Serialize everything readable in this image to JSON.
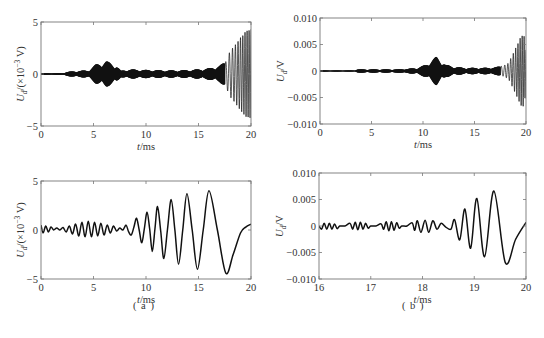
{
  "figure": {
    "panel_labels": [
      "( a )",
      "( b )"
    ]
  },
  "chart_data": [
    {
      "id": "a-top",
      "type": "line",
      "panel": "a",
      "title": "",
      "xlabel": "t/ms",
      "ylabel": "U_d/(×10⁻³ V)",
      "ylabel_parts": {
        "main": "U",
        "sub": "d",
        "rest": "/(×10",
        "sup": "−3",
        "tail": " V)"
      },
      "xlim": [
        0,
        20
      ],
      "ylim": [
        -5,
        5
      ],
      "xticks": [
        0,
        5,
        10,
        15,
        20
      ],
      "yticks": [
        -5,
        0,
        5
      ],
      "xtick_labels": [
        "0",
        "5",
        "10",
        "15",
        "20"
      ],
      "ytick_labels": [
        "−5",
        "0",
        "5"
      ],
      "grid": false,
      "legend": null,
      "description": "Dense high-frequency oscillation; quiet baseline 0–2 ms, packet peaking ~1.2 at ~6.2 ms, small periodic packets (~0.4) every ~1.2 ms from 7.5–16.5 ms, growing swing 17.5–20 ms reaching ~+4.1 / −4.3.",
      "envelope": {
        "x": [
          0,
          2,
          2.5,
          3.5,
          4.5,
          5.2,
          6.2,
          7.2,
          7.6,
          8.3,
          9.7,
          10.8,
          12,
          13,
          14,
          15,
          16,
          17,
          17.6,
          18,
          18.5,
          19,
          19.5,
          20
        ],
        "amplitude": [
          0.08,
          0.08,
          0.2,
          0.3,
          0.35,
          0.9,
          1.25,
          0.8,
          0.3,
          0.45,
          0.4,
          0.38,
          0.35,
          0.35,
          0.38,
          0.45,
          0.55,
          0.8,
          1.2,
          2.2,
          2.8,
          3.5,
          4.1,
          4.3
        ]
      },
      "carrier": {
        "description": "packets at ~1.2 ms spacing, carrier frequency high (dense fill)"
      }
    },
    {
      "id": "b-top",
      "type": "line",
      "panel": "b",
      "title": "",
      "xlabel": "t/ms",
      "ylabel": "U_d/V",
      "ylabel_parts": {
        "main": "U",
        "sub": "d",
        "rest": "/V"
      },
      "xlim": [
        0,
        20
      ],
      "ylim": [
        -0.01,
        0.01
      ],
      "xticks": [
        0,
        5,
        10,
        15,
        20
      ],
      "yticks": [
        -0.01,
        -0.005,
        0,
        0.005,
        0.01
      ],
      "xtick_labels": [
        "0",
        "5",
        "10",
        "15",
        "20"
      ],
      "ytick_labels": [
        "−0.010",
        "−0.005",
        "0",
        "0.005",
        "0.010"
      ],
      "grid": false,
      "legend": null,
      "description": "Flat until ~3.5 ms, tiny packets at ~4, ~6, ~8 ms; main packet peaking ~0.0025 at ~11.3 ms; small packets to ~18 ms; final growing swing reaching ~+0.0063 / −0.0070 near 19.5 ms.",
      "envelope": {
        "x": [
          0,
          3.4,
          3.6,
          4.5,
          5.8,
          6.8,
          7.5,
          8.5,
          9.5,
          10.3,
          11.3,
          12.2,
          13,
          14,
          15,
          16,
          17,
          17.8,
          18.3,
          18.8,
          19.2,
          19.5,
          19.8,
          20
        ],
        "amplitude": [
          0.0001,
          0.0001,
          0.0003,
          0.0003,
          0.0003,
          0.0003,
          0.0003,
          0.0004,
          0.0006,
          0.0012,
          0.0027,
          0.0012,
          0.0008,
          0.0006,
          0.0006,
          0.0006,
          0.0007,
          0.001,
          0.0015,
          0.0035,
          0.0052,
          0.0065,
          0.0068,
          0.004
        ]
      }
    },
    {
      "id": "a-bottom",
      "type": "line",
      "panel": "a",
      "title": "",
      "xlabel": "t/ms",
      "ylabel": "U_d/(×10⁻³ V)",
      "ylabel_parts": {
        "main": "U",
        "sub": "d",
        "rest": "/(×10",
        "sup": "−3",
        "tail": " V)"
      },
      "xlim": [
        0,
        20
      ],
      "ylim": [
        -5,
        5
      ],
      "xticks": [
        0,
        5,
        10,
        15,
        20
      ],
      "yticks": [
        -5,
        0,
        5
      ],
      "xtick_labels": [
        "0",
        "5",
        "10",
        "15",
        "20"
      ],
      "ytick_labels": [
        "−5",
        "0",
        "5"
      ],
      "grid": false,
      "legend": null,
      "description": "Filtered low-frequency waveform; small oscillations (~0.5) to 8 ms, then growing oscillation with period ~1.3 ms; final large trough ~−4.4 at 17.6 ms, rising to ~+0.6 at 20 ms.",
      "peaks": {
        "x": [
          9.1,
          10.1,
          11.1,
          12.4,
          13.9,
          16.0
        ],
        "y": [
          1.2,
          1.8,
          2.4,
          3.1,
          3.7,
          4.0
        ]
      },
      "troughs": {
        "x": [
          8.6,
          9.6,
          10.6,
          11.7,
          13.1,
          14.9,
          17.6
        ],
        "y": [
          -0.5,
          -1.3,
          -2.2,
          -2.9,
          -3.5,
          -4.0,
          -4.4
        ]
      },
      "points": {
        "x": [
          0,
          0.2,
          0.45,
          0.7,
          0.95,
          1.2,
          1.5,
          1.8,
          2.1,
          2.4,
          2.7,
          3.0,
          3.3,
          3.6,
          3.9,
          4.2,
          4.5,
          4.8,
          5.1,
          5.4,
          5.7,
          6.0,
          6.3,
          6.6,
          6.9,
          7.2,
          7.5,
          7.8,
          8.1,
          8.35,
          8.6,
          8.85,
          9.1,
          9.35,
          9.6,
          9.85,
          10.1,
          10.35,
          10.6,
          10.85,
          11.1,
          11.4,
          11.7,
          12.05,
          12.4,
          12.75,
          13.1,
          13.5,
          13.9,
          14.4,
          14.9,
          15.45,
          16.0,
          16.8,
          17.6,
          18.3,
          19.0,
          19.5,
          20.0
        ],
        "y": [
          0.5,
          -0.3,
          0.4,
          -0.2,
          0.3,
          0.0,
          0.2,
          0.0,
          0.25,
          -0.2,
          0.4,
          -0.4,
          0.6,
          -0.6,
          0.8,
          -0.7,
          0.9,
          -0.7,
          0.8,
          -0.6,
          0.7,
          -0.5,
          0.5,
          -0.3,
          0.4,
          -0.1,
          0.2,
          0.0,
          0.5,
          -0.2,
          -0.5,
          0.3,
          1.2,
          0.0,
          -1.3,
          0.2,
          1.8,
          0.1,
          -2.2,
          0.1,
          2.4,
          -0.1,
          -2.9,
          0.1,
          3.1,
          0.0,
          -3.5,
          0.0,
          3.7,
          0.0,
          -4.0,
          0.0,
          4.0,
          0.0,
          -4.4,
          -2.5,
          -0.3,
          0.3,
          0.6
        ]
      }
    },
    {
      "id": "b-bottom",
      "type": "line",
      "panel": "b",
      "title": "",
      "xlabel": "t/ms",
      "ylabel": "U_d/V",
      "ylabel_parts": {
        "main": "U",
        "sub": "d",
        "rest": "/V"
      },
      "xlim": [
        16,
        20
      ],
      "ylim": [
        -0.01,
        0.01
      ],
      "xticks": [
        16,
        17,
        18,
        19,
        20
      ],
      "yticks": [
        -0.01,
        -0.005,
        0,
        0.005,
        0.01
      ],
      "xtick_labels": [
        "16",
        "17",
        "18",
        "19",
        "20"
      ],
      "ytick_labels": [
        "−0.010",
        "−0.005",
        "0",
        "0.005",
        "0.010"
      ],
      "grid": false,
      "legend": null,
      "description": "Zoom of last 4 ms; small ripples (~0.0005) in groups through 18.4 ms, then growing swings: peaks 0.0012@18.6, 0.0052@18.8, 0.0053@19.05, 0.0066@19.4; troughs −0.0025@18.7, −0.0042@18.93, −0.0058@19.2, −0.0069@19.6; rising to ~0.0007 at 20 ms.",
      "peaks": {
        "x": [
          18.62,
          18.82,
          19.05,
          19.38
        ],
        "y": [
          0.0012,
          0.0032,
          0.0052,
          0.0066
        ]
      },
      "troughs": {
        "x": [
          18.72,
          18.93,
          19.2,
          19.6
        ],
        "y": [
          -0.0026,
          -0.0042,
          -0.0058,
          -0.0069
        ]
      },
      "points": {
        "x": [
          16.0,
          16.05,
          16.1,
          16.15,
          16.2,
          16.25,
          16.3,
          16.35,
          16.4,
          16.5,
          16.6,
          16.65,
          16.7,
          16.75,
          16.8,
          16.85,
          16.9,
          16.95,
          17.0,
          17.1,
          17.2,
          17.25,
          17.3,
          17.35,
          17.4,
          17.45,
          17.5,
          17.55,
          17.6,
          17.7,
          17.8,
          17.85,
          17.9,
          17.97,
          18.05,
          18.12,
          18.2,
          18.28,
          18.36,
          18.45,
          18.55,
          18.62,
          18.72,
          18.82,
          18.93,
          19.05,
          19.2,
          19.38,
          19.6,
          19.8,
          20.0
        ],
        "y": [
          0.0,
          -0.0006,
          0.0005,
          -0.0006,
          0.0005,
          -0.0006,
          0.0004,
          -0.0005,
          0.0,
          0.0,
          0.0005,
          -0.0006,
          0.0007,
          -0.0007,
          0.0007,
          -0.0006,
          0.0005,
          -0.0004,
          0.0,
          0.0,
          0.0004,
          -0.0006,
          0.0008,
          -0.0009,
          0.0008,
          -0.0008,
          0.0006,
          -0.0004,
          0.0,
          0.0,
          0.0006,
          -0.0008,
          0.001,
          -0.0012,
          0.0011,
          -0.0012,
          0.001,
          -0.0006,
          0.0005,
          -0.0002,
          -0.0006,
          0.0012,
          -0.0026,
          0.0032,
          -0.0042,
          0.0052,
          -0.0058,
          0.0066,
          -0.0069,
          -0.0025,
          0.0007
        ]
      }
    }
  ]
}
